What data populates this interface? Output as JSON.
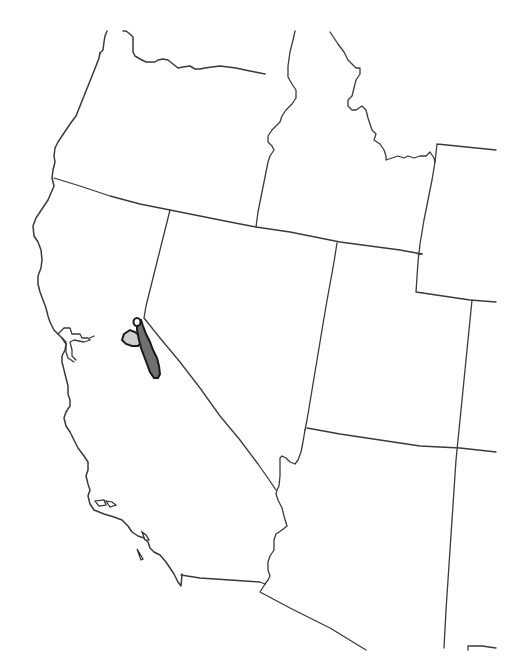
{
  "map": {
    "type": "species range map",
    "region": "Western United States",
    "background": "#ffffff",
    "line_color": "#3a3a3a",
    "states": [
      "Oregon",
      "Idaho",
      "California",
      "Nevada",
      "Utah",
      "Arizona",
      "Wyoming",
      "Colorado"
    ],
    "range": {
      "primary": {
        "label": "Primary range (Sierra Nevada)",
        "fill": "#707070"
      },
      "secondary": {
        "label": "Secondary range",
        "fill": "#cfcfcf"
      },
      "isolated": {
        "label": "Isolated population",
        "fill": "#ffffff"
      }
    }
  }
}
